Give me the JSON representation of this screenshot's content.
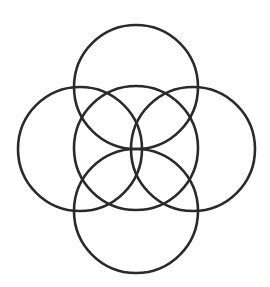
{
  "diagram": {
    "title": "",
    "canvas": {
      "width": 270,
      "height": 287,
      "background": "#ffffff"
    },
    "stroke": {
      "color": "#2a2a2a",
      "width": 2.6
    },
    "radius": 62,
    "circles": [
      {
        "id": "top",
        "cx": 136,
        "cy": 87
      },
      {
        "id": "left",
        "cx": 80,
        "cy": 149
      },
      {
        "id": "center",
        "cx": 136,
        "cy": 148
      },
      {
        "id": "right",
        "cx": 193,
        "cy": 149
      },
      {
        "id": "bottom",
        "cx": 136,
        "cy": 211
      }
    ]
  }
}
